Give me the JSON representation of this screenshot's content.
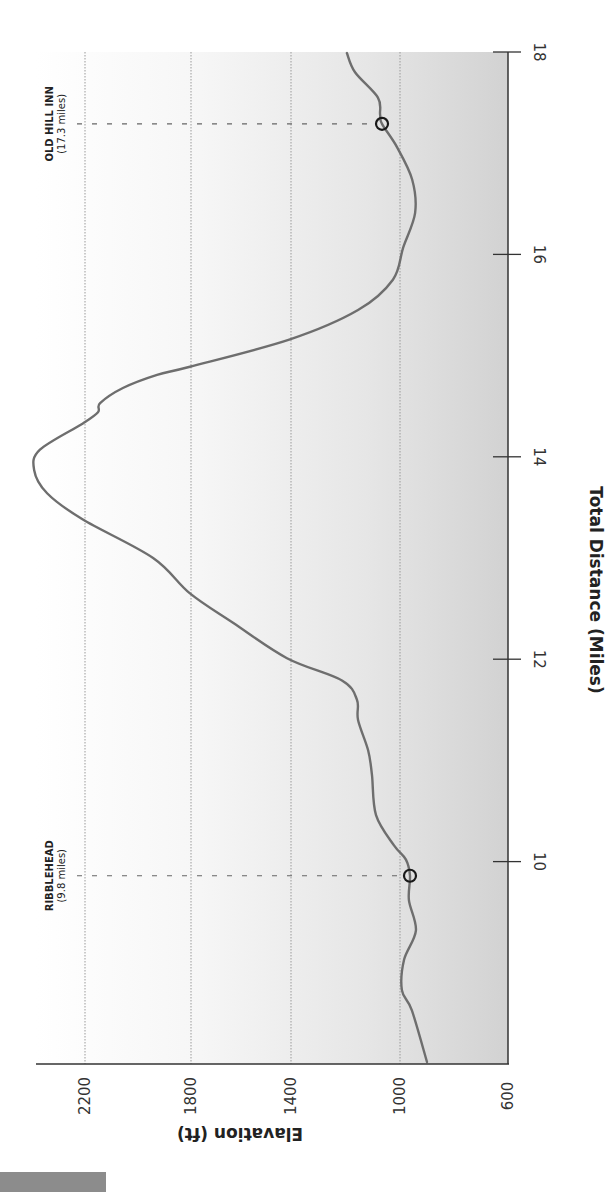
{
  "chart_data": {
    "type": "line",
    "title": "",
    "xlabel": "Total Distance (Miles)",
    "ylabel": "Elavation (ft)",
    "orientation": "rotated-90-cw",
    "xlim": [
      8,
      18
    ],
    "ylim": [
      600,
      2400
    ],
    "x_ticks": [
      10,
      12,
      14,
      16,
      18
    ],
    "y_ticks": [
      600,
      1000,
      1400,
      1800,
      2200
    ],
    "grid": {
      "y_lines": [
        1000,
        1400,
        1800,
        2200
      ],
      "style": "dotted"
    },
    "series": [
      {
        "name": "Elevation profile",
        "color": "#6e6e6e",
        "points": [
          [
            8.02,
            900
          ],
          [
            8.53,
            956
          ],
          [
            8.73,
            993
          ],
          [
            9.03,
            985
          ],
          [
            9.32,
            941
          ],
          [
            9.62,
            967
          ],
          [
            9.86,
            963
          ],
          [
            10.02,
            978
          ],
          [
            10.16,
            1022
          ],
          [
            10.46,
            1088
          ],
          [
            10.86,
            1103
          ],
          [
            11.1,
            1117
          ],
          [
            11.4,
            1154
          ],
          [
            11.6,
            1158
          ],
          [
            11.79,
            1213
          ],
          [
            12.01,
            1416
          ],
          [
            12.36,
            1632
          ],
          [
            12.65,
            1804
          ],
          [
            13.0,
            1943
          ],
          [
            13.38,
            2208
          ],
          [
            13.64,
            2343
          ],
          [
            13.87,
            2392
          ],
          [
            14.07,
            2370
          ],
          [
            14.33,
            2208
          ],
          [
            14.44,
            2151
          ],
          [
            14.53,
            2143
          ],
          [
            14.68,
            2057
          ],
          [
            14.81,
            1928
          ],
          [
            14.89,
            1804
          ],
          [
            15.16,
            1404
          ],
          [
            15.45,
            1154
          ],
          [
            15.75,
            1026
          ],
          [
            16.07,
            988
          ],
          [
            16.41,
            944
          ],
          [
            16.74,
            955
          ],
          [
            17.06,
            1011
          ],
          [
            17.29,
            1066
          ],
          [
            17.38,
            1073
          ],
          [
            17.55,
            1081
          ],
          [
            17.8,
            1165
          ],
          [
            17.99,
            1195
          ]
        ]
      }
    ],
    "annotations": [
      {
        "name": "ribblehead",
        "title": "RIBBLEHEAD",
        "subtitle": "(9.8 miles)",
        "mile": 9.86,
        "elevation": 963
      },
      {
        "name": "old-hill-inn",
        "title": "OLD HILL INN",
        "subtitle": "(17.3 miles)",
        "mile": 17.29,
        "elevation": 1066
      }
    ]
  },
  "colors": {
    "line": "#6e6e6e",
    "axis": "#333333",
    "grid": "#9a9a9a",
    "bg_light": "#ffffff",
    "bg_dark": "#d2d2d2",
    "marker": "#1a1a1a",
    "corner_bar": "#8c8c8c"
  }
}
